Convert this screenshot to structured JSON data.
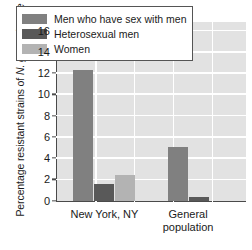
{
  "chart_data": {
    "type": "bar",
    "title": "",
    "xlabel": "",
    "ylabel": "Percentage resistant strains of N. gonorrhoeae",
    "ylabel_plain": "Percentage resistant strains of ",
    "ylabel_italic": "N. gonorrhoeae",
    "categories": [
      "New York, NY",
      "General population"
    ],
    "ylim": [
      0,
      16.8
    ],
    "yticks": [
      0,
      2,
      4,
      6,
      8,
      10,
      12,
      14,
      16
    ],
    "ytick_labels": [
      "0",
      "2",
      "4",
      "6",
      "8",
      "10",
      "12",
      "14",
      "16"
    ],
    "grid": true,
    "legend_position": "top-inside",
    "series": [
      {
        "name": "Men who have sex with men",
        "color": "#808080",
        "values": [
          12.3,
          5.0
        ]
      },
      {
        "name": "Heterosexual men",
        "color": "#595959",
        "values": [
          1.6,
          0.3
        ]
      },
      {
        "name": "Women",
        "color": "#b3b3b3",
        "values": [
          2.4,
          null
        ]
      }
    ]
  },
  "legend": {
    "items": [
      {
        "label": "Men who have sex with men",
        "color": "#808080"
      },
      {
        "label": "Heterosexual men",
        "color": "#595959"
      },
      {
        "label": "Women",
        "color": "#b3b3b3"
      }
    ]
  },
  "colors": {
    "plot_background": "#e2e2e2",
    "gridline": "#ffffff",
    "axis": "#4a4a4a",
    "text": "#1a1a1a",
    "page_background": "#ffffff"
  }
}
